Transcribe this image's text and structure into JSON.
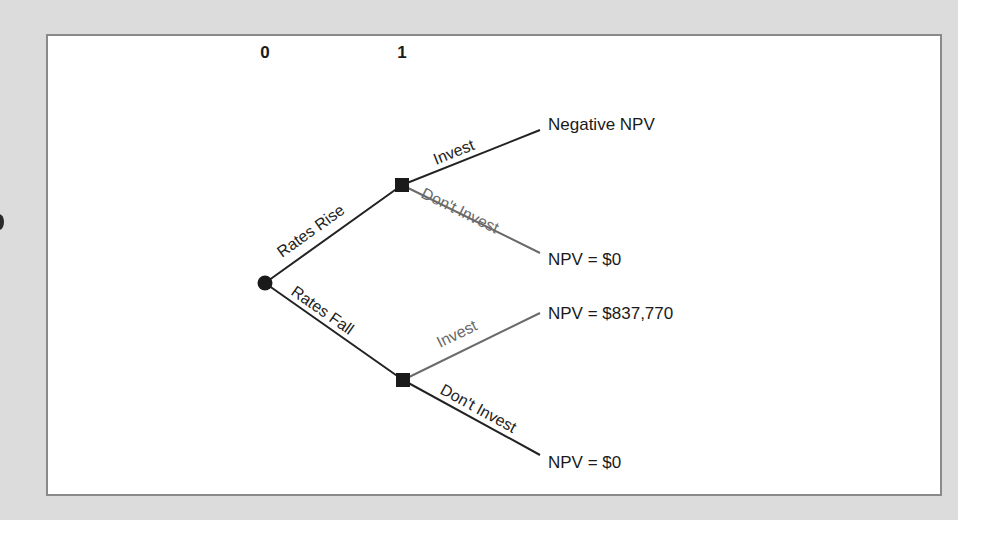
{
  "figure": {
    "type": "decision-tree",
    "periods": [
      {
        "label": "0"
      },
      {
        "label": "1"
      }
    ],
    "root": {
      "shape": "circle",
      "kind": "chance-node",
      "branches": [
        {
          "label": "Rates Rise",
          "decision_node": {
            "shape": "square",
            "branches": [
              {
                "label": "Invest",
                "outcome": "Negative NPV",
                "style": "dark"
              },
              {
                "label": "Don't Invest",
                "outcome": "NPV = $0",
                "style": "gray"
              }
            ]
          }
        },
        {
          "label": "Rates Fall",
          "decision_node": {
            "shape": "square",
            "branches": [
              {
                "label": "Invest",
                "outcome": "NPV = $837,770",
                "style": "gray"
              },
              {
                "label": "Don't Invest",
                "outcome": "NPV = $0",
                "style": "dark"
              }
            ]
          }
        }
      ]
    },
    "colors": {
      "outer_background": "#dcdcdc",
      "panel_background": "#ffffff",
      "panel_border": "#8a8a8a",
      "line_dark": "#222222",
      "line_gray": "#6a6a6a"
    }
  }
}
